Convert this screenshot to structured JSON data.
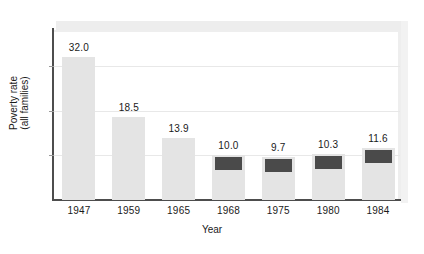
{
  "chart_data": {
    "type": "bar",
    "title": "",
    "xlabel": "Year",
    "ylabel": "Poverty rate\n(all families)",
    "ylabel_line1": "Poverty rate",
    "ylabel_line2": "(all families)",
    "categories": [
      "1947",
      "1959",
      "1965",
      "1968",
      "1975",
      "1980",
      "1984"
    ],
    "values": [
      32.0,
      18.5,
      13.9,
      10.0,
      9.7,
      10.3,
      11.6
    ],
    "value_labels": [
      "32.0",
      "18.5",
      "13.9",
      "10.0",
      "9.7",
      "10.3",
      "11.6"
    ],
    "series": [
      {
        "name": "Poverty rate (all families)",
        "values": [
          32.0,
          18.5,
          13.9,
          10.0,
          9.7,
          10.3,
          11.6
        ]
      }
    ],
    "highlighted_categories": [
      "1968",
      "1975",
      "1980",
      "1984"
    ],
    "ylim": [
      0,
      38
    ],
    "xlim_categories": 7,
    "grid": true,
    "gridlines_y": [
      10,
      20,
      30
    ],
    "legend": "none",
    "bar_fill_color": "#e4e4e4",
    "bar_cap_color": "#4a4a4a",
    "axis_color": "#4d4d4d",
    "grid_color": "#e8e8e8",
    "background_color": "#ffffff"
  },
  "axis": {
    "y_title_line1": "Poverty rate",
    "y_title_line2": "(all families)",
    "x_title": "Year"
  }
}
